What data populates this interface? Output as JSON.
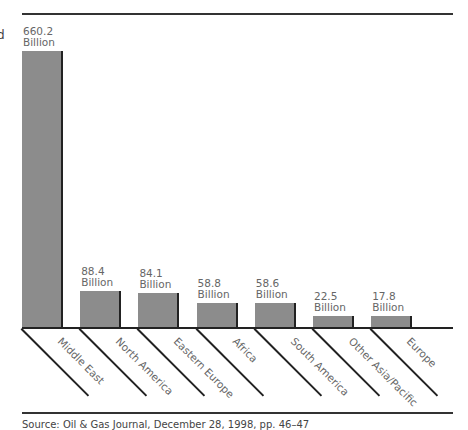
{
  "chart_data": {
    "type": "bar",
    "title": "",
    "xlabel": "",
    "ylabel": "",
    "categories": [
      "Middle East",
      "North America",
      "Eastern Europe",
      "Africa",
      "South America",
      "Other Asia/Pacific",
      "Europe"
    ],
    "values": [
      660.2,
      88.4,
      84.1,
      58.8,
      58.6,
      22.5,
      17.8
    ],
    "value_labels": [
      {
        "number": "660.2",
        "unit": "Billion"
      },
      {
        "number": "88.4",
        "unit": "Billion"
      },
      {
        "number": "84.1",
        "unit": "Billion"
      },
      {
        "number": "58.8",
        "unit": "Billion"
      },
      {
        "number": "58.6",
        "unit": "Billion"
      },
      {
        "number": "22.5",
        "unit": "Billion"
      },
      {
        "number": "17.8",
        "unit": "Billion"
      }
    ],
    "unit": "Billion",
    "grid": false,
    "legend": null,
    "label_rotation": 45,
    "colors": {
      "bar": "#8c8c8c",
      "bar_edge": "#222222",
      "rule": "#333333"
    }
  },
  "edge_glyph": "d",
  "source": "Source: Oil & Gas Journal, December 28, 1998, pp. 46–47"
}
